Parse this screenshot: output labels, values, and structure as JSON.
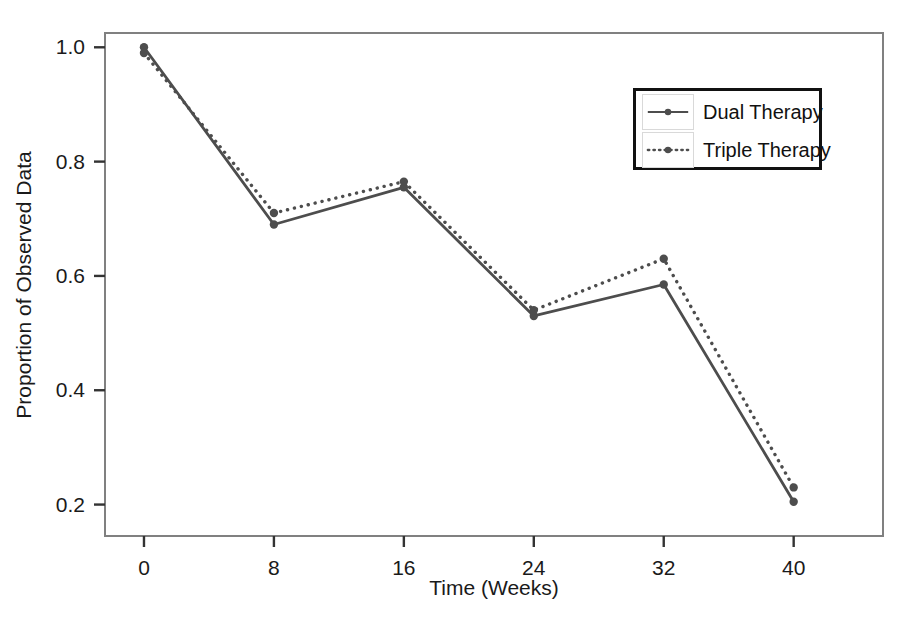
{
  "chart_data": {
    "type": "line",
    "title": "",
    "xlabel": "Time (Weeks)",
    "ylabel": "Proportion of Observed Data",
    "x": [
      0,
      8,
      16,
      24,
      32,
      40
    ],
    "xticks": [
      "0",
      "8",
      "16",
      "24",
      "32",
      "40"
    ],
    "yticks": [
      "0.2",
      "0.4",
      "0.6",
      "0.8",
      "1.0"
    ],
    "ytickvalues": [
      0.2,
      0.4,
      0.6,
      0.8,
      1.0
    ],
    "xlim": [
      -2.4,
      45.5
    ],
    "ylim": [
      0.145,
      1.025
    ],
    "grid": false,
    "legend_position": "top-right",
    "series": [
      {
        "name": "Dual Therapy",
        "style": "solid",
        "color": "#4d4d4d",
        "marker": "circle",
        "values": [
          1.0,
          0.69,
          0.755,
          0.53,
          0.585,
          0.205
        ]
      },
      {
        "name": "Triple Therapy",
        "style": "dotted",
        "color": "#4d4d4d",
        "marker": "circle",
        "values": [
          0.99,
          0.71,
          0.765,
          0.54,
          0.63,
          0.23
        ]
      }
    ]
  },
  "axes": {
    "frame_color": "#808080",
    "text_color": "#1a1a1a"
  },
  "legend": {
    "entries": [
      {
        "label": "Dual Therapy"
      },
      {
        "label": "Triple Therapy"
      }
    ]
  }
}
